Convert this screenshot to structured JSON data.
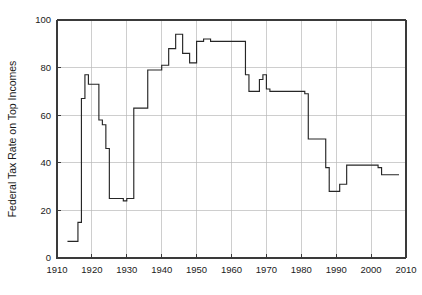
{
  "chart_data": {
    "type": "line",
    "line_style": "step-post",
    "title": "",
    "subtitle": "",
    "xlabel": "",
    "ylabel": "Federal Tax Rate on Top Incomes",
    "xlim": [
      1910,
      2010
    ],
    "ylim": [
      0,
      100
    ],
    "xticks": [
      1910,
      1920,
      1930,
      1940,
      1950,
      1960,
      1970,
      1980,
      1990,
      2000,
      2010
    ],
    "xtick_labels": [
      "1910",
      "1920",
      "1930",
      "1940",
      "1950",
      "1960",
      "1970",
      "1980",
      "1990",
      "2000",
      "2010"
    ],
    "yticks": [
      0,
      20,
      40,
      60,
      80,
      100
    ],
    "ytick_labels": [
      "0",
      "20",
      "40",
      "60",
      "80",
      "100"
    ],
    "grid": true,
    "grid_axis": "y",
    "legend": null,
    "legend_position": "none",
    "series": [
      {
        "name": "Federal Tax Rate on Top Incomes",
        "color": "#262626",
        "x": [
          1913,
          1914,
          1915,
          1916,
          1917,
          1918,
          1919,
          1920,
          1921,
          1922,
          1923,
          1924,
          1925,
          1926,
          1927,
          1928,
          1929,
          1930,
          1931,
          1932,
          1933,
          1934,
          1935,
          1936,
          1937,
          1938,
          1939,
          1940,
          1941,
          1942,
          1943,
          1944,
          1945,
          1946,
          1947,
          1948,
          1949,
          1950,
          1951,
          1952,
          1953,
          1954,
          1955,
          1956,
          1957,
          1958,
          1959,
          1960,
          1961,
          1962,
          1963,
          1964,
          1965,
          1966,
          1967,
          1968,
          1969,
          1970,
          1971,
          1972,
          1973,
          1974,
          1975,
          1976,
          1977,
          1978,
          1979,
          1980,
          1981,
          1982,
          1983,
          1984,
          1985,
          1986,
          1987,
          1988,
          1989,
          1990,
          1991,
          1992,
          1993,
          1994,
          1995,
          1996,
          1997,
          1998,
          1999,
          2000,
          2001,
          2002,
          2003,
          2004,
          2005,
          2006,
          2007
        ],
        "values": [
          7,
          7,
          7,
          15,
          67,
          77,
          73,
          73,
          73,
          58,
          56,
          46,
          25,
          25,
          25,
          25,
          24,
          25,
          25,
          63,
          63,
          63,
          63,
          79,
          79,
          79,
          79,
          81,
          81,
          88,
          88,
          94,
          94,
          86,
          86,
          82,
          82,
          91,
          91,
          92,
          92,
          91,
          91,
          91,
          91,
          91,
          91,
          91,
          91,
          91,
          91,
          77,
          70,
          70,
          70,
          75,
          77,
          71,
          70,
          70,
          70,
          70,
          70,
          70,
          70,
          70,
          70,
          70,
          69,
          50,
          50,
          50,
          50,
          50,
          38,
          28,
          28,
          28,
          31,
          31,
          39,
          39,
          39,
          39,
          39,
          39,
          39,
          39,
          39,
          38,
          35,
          35,
          35,
          35,
          35
        ]
      }
    ]
  },
  "axis": {
    "ylabel": "Federal Tax Rate on Top Incomes"
  }
}
